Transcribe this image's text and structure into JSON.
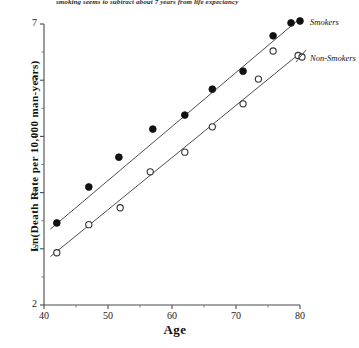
{
  "caption": "smoking seems to subtract about 7 years from life expectancy",
  "chart_data": {
    "type": "scatter",
    "title": "",
    "xlabel": "Age",
    "ylabel": "Ln(Death Rate per 10,000 man-years)",
    "xlim": [
      40,
      80
    ],
    "ylim": [
      2,
      7
    ],
    "xticks": [
      40,
      50,
      60,
      70,
      80
    ],
    "xminorticks": [
      45,
      55,
      65,
      75
    ],
    "yticks": [
      2,
      3,
      4,
      5,
      6,
      7
    ],
    "yminorticks": [
      2.5,
      3.5,
      4.5,
      5.5,
      6.5
    ],
    "grid": false,
    "legend_position": "right",
    "series": [
      {
        "name": "Smokers",
        "marker": "filled-circle",
        "color": "#111111",
        "points": [
          {
            "x": 42.0,
            "y": 3.46
          },
          {
            "x": 47.0,
            "y": 4.1
          },
          {
            "x": 51.7,
            "y": 4.63
          },
          {
            "x": 57.0,
            "y": 5.13
          },
          {
            "x": 62.0,
            "y": 5.38
          },
          {
            "x": 66.3,
            "y": 5.84
          },
          {
            "x": 71.1,
            "y": 6.16
          },
          {
            "x": 75.8,
            "y": 6.79
          },
          {
            "x": 78.6,
            "y": 7.02
          }
        ],
        "fit_line": {
          "x0": 41.0,
          "y0": 3.35,
          "x1": 79.5,
          "y1": 7.05
        }
      },
      {
        "name": "Non-Smokers",
        "marker": "open-circle",
        "color": "#333333",
        "points": [
          {
            "x": 42.0,
            "y": 2.93
          },
          {
            "x": 47.0,
            "y": 3.43
          },
          {
            "x": 51.9,
            "y": 3.73
          },
          {
            "x": 56.6,
            "y": 4.37
          },
          {
            "x": 62.0,
            "y": 4.72
          },
          {
            "x": 66.3,
            "y": 5.17
          },
          {
            "x": 71.1,
            "y": 5.58
          },
          {
            "x": 73.5,
            "y": 6.02
          },
          {
            "x": 75.8,
            "y": 6.52
          },
          {
            "x": 79.7,
            "y": 6.44
          }
        ],
        "fit_line": {
          "x0": 41.0,
          "y0": 2.86,
          "x1": 80.0,
          "y1": 6.48
        }
      }
    ]
  },
  "legend": {
    "smokers_label": "Smokers",
    "nonsmokers_label": "Non-Smokers"
  }
}
